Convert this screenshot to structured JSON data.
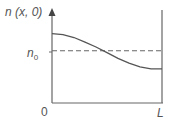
{
  "diagram": {
    "y_axis_label": "n (x, 0)",
    "x_start_label": "0",
    "x_end_label": "L",
    "reference_level_label": "n",
    "reference_level_subscript": "0",
    "colors": {
      "axis": "#666666",
      "curve": "#555555",
      "dashed": "#666666",
      "text": "#555555"
    }
  },
  "chart_data": {
    "type": "line",
    "title": "",
    "xlabel": "",
    "ylabel": "n (x, 0)",
    "x_ticks": [
      "0",
      "L"
    ],
    "y_ticks": [
      "n0"
    ],
    "xlim": [
      0,
      1
    ],
    "ylim": [
      0,
      1
    ],
    "series": [
      {
        "name": "n(x,0)",
        "style": "solid",
        "x": [
          0,
          0.1,
          0.2,
          0.3,
          0.4,
          0.5,
          0.6,
          0.7,
          0.8,
          0.9,
          1.0
        ],
        "y": [
          0.73,
          0.72,
          0.69,
          0.64,
          0.59,
          0.53,
          0.47,
          0.42,
          0.38,
          0.36,
          0.36
        ]
      },
      {
        "name": "n0",
        "style": "dashed",
        "x": [
          0,
          1
        ],
        "y": [
          0.55,
          0.55
        ]
      }
    ],
    "grid": false
  }
}
